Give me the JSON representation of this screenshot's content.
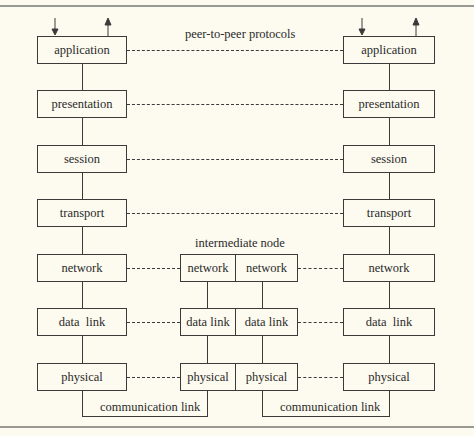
{
  "diagram": {
    "title_label": "peer-to-peer protocols",
    "intermediate_label": "intermediate node",
    "link_label": "communication link",
    "end_host_layers": [
      "application",
      "presentation",
      "session",
      "transport",
      "network",
      "data  link",
      "physical"
    ],
    "intermediate_layers": [
      "network",
      "data link",
      "physical"
    ],
    "colors": {
      "background": "#fdfbf0",
      "stroke": "#3a3a3a",
      "rule": "#9a9a94"
    }
  }
}
